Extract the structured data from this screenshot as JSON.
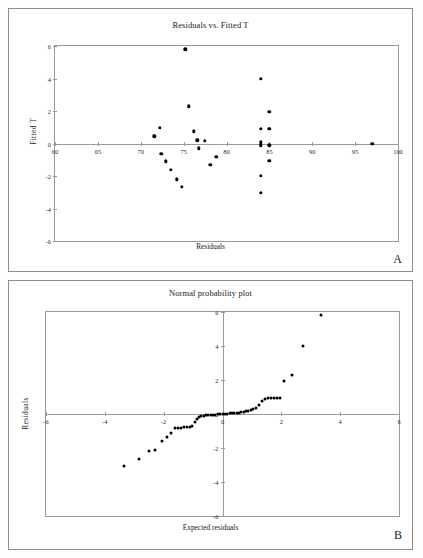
{
  "figure": {
    "panels": [
      {
        "letter": "A",
        "title": "Residuals vs. Fitted T",
        "xlabel": "Residuals",
        "ylabel": "Fitted T"
      },
      {
        "letter": "B",
        "title": "Normal probability plot",
        "xlabel": "Expected residuals",
        "ylabel": "Residuals"
      }
    ]
  },
  "chart_data": [
    {
      "type": "scatter",
      "title": "Residuals vs. Fitted T",
      "xlabel": "Residuals",
      "ylabel": "Fitted T",
      "xlim": [
        60,
        100
      ],
      "ylim": [
        -6,
        6
      ],
      "xticks": [
        60,
        65,
        70,
        75,
        80,
        85,
        90,
        95,
        100
      ],
      "yticks": [
        6,
        4,
        2,
        0,
        -2,
        -4,
        -6
      ],
      "grid": false,
      "legend": "none",
      "points": [
        {
          "x": 71.6,
          "y": 0.45
        },
        {
          "x": 72.2,
          "y": 0.95
        },
        {
          "x": 72.4,
          "y": -0.65
        },
        {
          "x": 72.9,
          "y": -1.1
        },
        {
          "x": 73.5,
          "y": -1.6
        },
        {
          "x": 74.2,
          "y": -2.2
        },
        {
          "x": 74.8,
          "y": -2.65
        },
        {
          "x": 75.2,
          "y": 5.8
        },
        {
          "x": 75.6,
          "y": 2.3
        },
        {
          "x": 76.2,
          "y": 0.75
        },
        {
          "x": 76.6,
          "y": 0.2
        },
        {
          "x": 76.8,
          "y": -0.3
        },
        {
          "x": 77.5,
          "y": 0.15
        },
        {
          "x": 78.1,
          "y": -1.3
        },
        {
          "x": 78.8,
          "y": -0.8
        },
        {
          "x": 84.0,
          "y": 4.0
        },
        {
          "x": 84.0,
          "y": 0.9
        },
        {
          "x": 84.0,
          "y": 0.1
        },
        {
          "x": 84.0,
          "y": -0.05
        },
        {
          "x": 84.0,
          "y": -0.15
        },
        {
          "x": 84.0,
          "y": -2.0
        },
        {
          "x": 84.0,
          "y": -3.05
        },
        {
          "x": 85.0,
          "y": 1.95
        },
        {
          "x": 85.0,
          "y": 0.9
        },
        {
          "x": 85.0,
          "y": -0.1
        },
        {
          "x": 85.0,
          "y": -1.05
        },
        {
          "x": 97.0,
          "y": 0.0
        }
      ]
    },
    {
      "type": "scatter",
      "title": "Normal probability plot",
      "xlabel": "Expected residuals",
      "ylabel": "Residuals",
      "xlim": [
        -6,
        6
      ],
      "ylim": [
        -6,
        6
      ],
      "xticks": [
        -6,
        -4,
        -2,
        0,
        2,
        4,
        6
      ],
      "yticks": [
        6,
        4,
        2,
        0,
        -2,
        -4,
        -6
      ],
      "grid": false,
      "legend": "none",
      "points": [
        {
          "x": -3.35,
          "y": -3.05
        },
        {
          "x": -2.85,
          "y": -2.65
        },
        {
          "x": -2.5,
          "y": -2.2
        },
        {
          "x": -2.3,
          "y": -2.1
        },
        {
          "x": -2.05,
          "y": -1.6
        },
        {
          "x": -1.9,
          "y": -1.35
        },
        {
          "x": -1.75,
          "y": -1.1
        },
        {
          "x": -1.6,
          "y": -0.85
        },
        {
          "x": -1.5,
          "y": -0.8
        },
        {
          "x": -1.4,
          "y": -0.8
        },
        {
          "x": -1.3,
          "y": -0.78
        },
        {
          "x": -1.2,
          "y": -0.78
        },
        {
          "x": -1.1,
          "y": -0.75
        },
        {
          "x": -1.02,
          "y": -0.72
        },
        {
          "x": -0.95,
          "y": -0.45
        },
        {
          "x": -0.88,
          "y": -0.3
        },
        {
          "x": -0.8,
          "y": -0.18
        },
        {
          "x": -0.72,
          "y": -0.12
        },
        {
          "x": -0.64,
          "y": -0.09
        },
        {
          "x": -0.56,
          "y": -0.07
        },
        {
          "x": -0.48,
          "y": -0.06
        },
        {
          "x": -0.4,
          "y": -0.05
        },
        {
          "x": -0.32,
          "y": -0.04
        },
        {
          "x": -0.24,
          "y": -0.03
        },
        {
          "x": -0.16,
          "y": -0.02
        },
        {
          "x": -0.08,
          "y": -0.01
        },
        {
          "x": 0.0,
          "y": 0.0
        },
        {
          "x": 0.08,
          "y": 0.01
        },
        {
          "x": 0.16,
          "y": 0.02
        },
        {
          "x": 0.24,
          "y": 0.03
        },
        {
          "x": 0.32,
          "y": 0.04
        },
        {
          "x": 0.4,
          "y": 0.05
        },
        {
          "x": 0.48,
          "y": 0.06
        },
        {
          "x": 0.56,
          "y": 0.08
        },
        {
          "x": 0.64,
          "y": 0.1
        },
        {
          "x": 0.72,
          "y": 0.12
        },
        {
          "x": 0.8,
          "y": 0.15
        },
        {
          "x": 0.88,
          "y": 0.2
        },
        {
          "x": 0.96,
          "y": 0.22
        },
        {
          "x": 1.05,
          "y": 0.28
        },
        {
          "x": 1.15,
          "y": 0.35
        },
        {
          "x": 1.25,
          "y": 0.55
        },
        {
          "x": 1.35,
          "y": 0.78
        },
        {
          "x": 1.45,
          "y": 0.88
        },
        {
          "x": 1.55,
          "y": 0.92
        },
        {
          "x": 1.65,
          "y": 0.93
        },
        {
          "x": 1.75,
          "y": 0.94
        },
        {
          "x": 1.85,
          "y": 0.94
        },
        {
          "x": 1.95,
          "y": 0.95
        },
        {
          "x": 2.1,
          "y": 1.95
        },
        {
          "x": 2.35,
          "y": 2.3
        },
        {
          "x": 2.75,
          "y": 4.0
        },
        {
          "x": 3.35,
          "y": 5.8
        }
      ]
    }
  ]
}
